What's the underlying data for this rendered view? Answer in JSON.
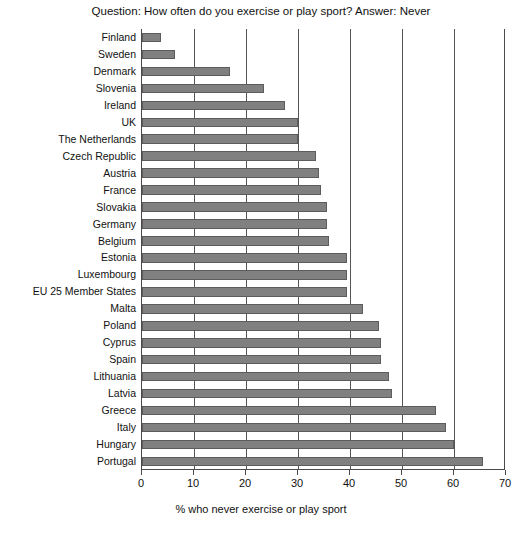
{
  "chart_data": {
    "type": "bar",
    "orientation": "horizontal",
    "title": "Question: How often do you exercise or play sport? Answer: Never",
    "xlabel": "% who never exercise or play sport",
    "ylabel": "",
    "xlim": [
      0,
      70
    ],
    "xticks": [
      0,
      10,
      20,
      30,
      40,
      50,
      60,
      70
    ],
    "grid": "vertical",
    "legend": "none",
    "bar_color": "#808080",
    "bar_border_color": "#5c5c5c",
    "axis_color": "#4a4a4a",
    "categories": [
      "Finland",
      "Sweden",
      "Denmark",
      "Slovenia",
      "Ireland",
      "UK",
      "The Netherlands",
      "Czech Republic",
      "Austria",
      "France",
      "Slovakia",
      "Germany",
      "Belgium",
      "Estonia",
      "Luxembourg",
      "EU 25 Member States",
      "Malta",
      "Poland",
      "Cyprus",
      "Spain",
      "Lithuania",
      "Latvia",
      "Greece",
      "Italy",
      "Hungary",
      "Portugal"
    ],
    "values": [
      3.6,
      6.3,
      17,
      23.5,
      27.5,
      30,
      30,
      33.5,
      34,
      34.5,
      35.5,
      35.5,
      36,
      39.5,
      39.5,
      39.5,
      42.5,
      45.5,
      46,
      46,
      47.5,
      48,
      56.5,
      58.5,
      60,
      65.5
    ],
    "xtick_labels": [
      "0",
      "10",
      "20",
      "30",
      "40",
      "50",
      "60",
      "70"
    ]
  }
}
